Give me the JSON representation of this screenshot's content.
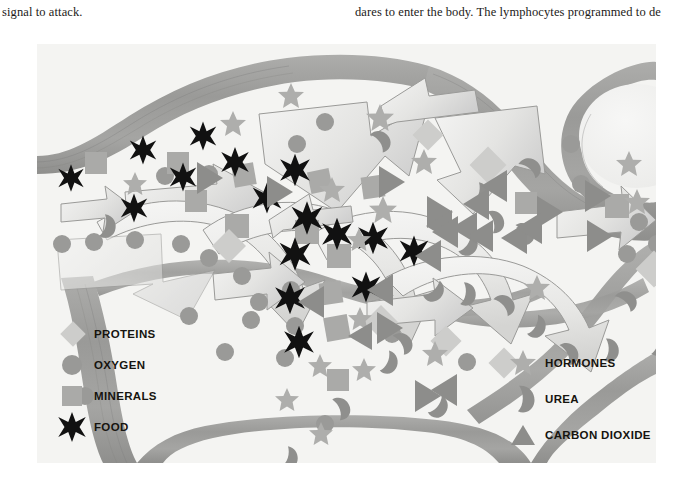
{
  "page": {
    "column_left_text": "signal to attack.",
    "column_right_text": "dares to enter the body. The lymphocytes programmed to de"
  },
  "figure": {
    "name": "capillary-exchange-diagram",
    "background_color": "#f4f4f2",
    "vessel_wall_color": "#9b9b99",
    "vessel_wall_shadow": "#8a8a88",
    "arrow_fill": "#ededec",
    "arrow_fill_dark": "#d9d9d7",
    "arrow_stroke": "#9a9a98"
  },
  "legend_left": {
    "name": "nutrients-legend",
    "items": [
      {
        "symbol": "diamond-icon",
        "label": "PROTEINS",
        "color": "#cdcdcb"
      },
      {
        "symbol": "circle-icon",
        "label": "OXYGEN",
        "color": "#999997"
      },
      {
        "symbol": "square-icon",
        "label": "MINERALS",
        "color": "#aaaaa8"
      },
      {
        "symbol": "asterisk-icon",
        "label": "FOOD",
        "color": "#111111"
      }
    ]
  },
  "legend_right": {
    "name": "wastes-legend",
    "items": [
      {
        "symbol": "star-icon",
        "label": "HORMONES",
        "color": "#aeaeac"
      },
      {
        "symbol": "kidney-icon",
        "label": "UREA",
        "color": "#8f8f8d"
      },
      {
        "symbol": "triangle-icon",
        "label": "CARBON DIOXIDE",
        "color": "#8d8d8b"
      }
    ]
  },
  "particles": {
    "legend_key": {
      "proteins": "diamond",
      "oxygen": "circle",
      "minerals": "square",
      "food": "asterisk",
      "hormones": "star",
      "urea": "kidney",
      "carbon_dioxide": "triangle"
    }
  }
}
